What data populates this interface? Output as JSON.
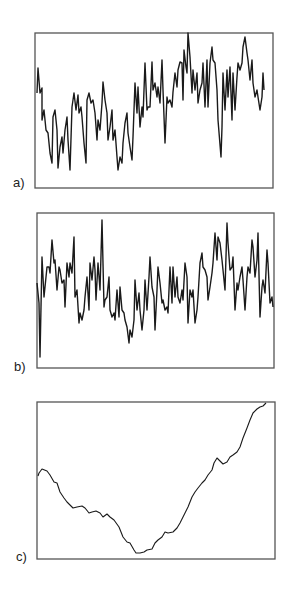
{
  "figure": {
    "panels": [
      {
        "label": "a)",
        "label_pos": [
          13,
          175
        ]
      },
      {
        "label": "b)",
        "label_pos": [
          14,
          359
        ]
      },
      {
        "label": "c)",
        "label_pos": [
          16,
          549
        ]
      }
    ]
  },
  "style": {
    "frame_color": "#555555",
    "line_color": "#1a1a1a",
    "background": "#ffffff"
  },
  "chart_data": [
    {
      "type": "line",
      "title": "a)",
      "xlabel": "",
      "ylabel": "",
      "grid": false,
      "legend": false,
      "frame": [
        35,
        33,
        273,
        188
      ],
      "note": "points in page pixel coordinates [x, y]",
      "points": [
        [
          37,
          93
        ],
        [
          38,
          68
        ],
        [
          40,
          93
        ],
        [
          42,
          88
        ],
        [
          42,
          120
        ],
        [
          44,
          110
        ],
        [
          46,
          130
        ],
        [
          48,
          133
        ],
        [
          50,
          153
        ],
        [
          52,
          163
        ],
        [
          53,
          117
        ],
        [
          55,
          110
        ],
        [
          57,
          130
        ],
        [
          58,
          168
        ],
        [
          60,
          147
        ],
        [
          62,
          137
        ],
        [
          63,
          153
        ],
        [
          65,
          130
        ],
        [
          67,
          117
        ],
        [
          68,
          140
        ],
        [
          70,
          170
        ],
        [
          72,
          107
        ],
        [
          74,
          93
        ],
        [
          76,
          110
        ],
        [
          78,
          95
        ],
        [
          79,
          113
        ],
        [
          81,
          107
        ],
        [
          82,
          117
        ],
        [
          84,
          143
        ],
        [
          86,
          163
        ],
        [
          87,
          100
        ],
        [
          89,
          93
        ],
        [
          91,
          103
        ],
        [
          93,
          100
        ],
        [
          95,
          113
        ],
        [
          97,
          140
        ],
        [
          98,
          120
        ],
        [
          100,
          130
        ],
        [
          102,
          103
        ],
        [
          103,
          82
        ],
        [
          105,
          100
        ],
        [
          107,
          113
        ],
        [
          108,
          140
        ],
        [
          110,
          127
        ],
        [
          112,
          110
        ],
        [
          113,
          140
        ],
        [
          115,
          130
        ],
        [
          117,
          157
        ],
        [
          118,
          170
        ],
        [
          120,
          157
        ],
        [
          122,
          163
        ],
        [
          123,
          143
        ],
        [
          125,
          123
        ],
        [
          127,
          113
        ],
        [
          128,
          133
        ],
        [
          130,
          147
        ],
        [
          132,
          160
        ],
        [
          133,
          137
        ],
        [
          135,
          83
        ],
        [
          137,
          113
        ],
        [
          138,
          87
        ],
        [
          140,
          127
        ],
        [
          142,
          107
        ],
        [
          143,
          117
        ],
        [
          145,
          63
        ],
        [
          147,
          110
        ],
        [
          148,
          107
        ],
        [
          150,
          107
        ],
        [
          152,
          62
        ],
        [
          153,
          90
        ],
        [
          155,
          83
        ],
        [
          157,
          97
        ],
        [
          158,
          87
        ],
        [
          160,
          103
        ],
        [
          162,
          60
        ],
        [
          163,
          90
        ],
        [
          165,
          143
        ],
        [
          167,
          97
        ],
        [
          168,
          103
        ],
        [
          170,
          100
        ],
        [
          172,
          107
        ],
        [
          173,
          92
        ],
        [
          175,
          73
        ],
        [
          177,
          87
        ],
        [
          178,
          70
        ],
        [
          180,
          62
        ],
        [
          182,
          63
        ],
        [
          183,
          100
        ],
        [
          184,
          50
        ],
        [
          186,
          67
        ],
        [
          187,
          73
        ],
        [
          188,
          33
        ],
        [
          190,
          57
        ],
        [
          192,
          93
        ],
        [
          193,
          70
        ],
        [
          195,
          90
        ],
        [
          197,
          73
        ],
        [
          198,
          103
        ],
        [
          200,
          90
        ],
        [
          202,
          83
        ],
        [
          203,
          63
        ],
        [
          205,
          107
        ],
        [
          207,
          60
        ],
        [
          208,
          107
        ],
        [
          210,
          63
        ],
        [
          212,
          47
        ],
        [
          213,
          60
        ],
        [
          215,
          63
        ],
        [
          217,
          90
        ],
        [
          218,
          120
        ],
        [
          221,
          157
        ],
        [
          222,
          127
        ],
        [
          223,
          73
        ],
        [
          225,
          110
        ],
        [
          227,
          70
        ],
        [
          228,
          97
        ],
        [
          230,
          67
        ],
        [
          232,
          120
        ],
        [
          233,
          73
        ],
        [
          235,
          110
        ],
        [
          237,
          77
        ],
        [
          238,
          63
        ],
        [
          240,
          70
        ],
        [
          242,
          63
        ],
        [
          243,
          47
        ],
        [
          245,
          37
        ],
        [
          247,
          53
        ],
        [
          248,
          60
        ],
        [
          250,
          80
        ],
        [
          252,
          60
        ],
        [
          253,
          83
        ],
        [
          255,
          97
        ],
        [
          257,
          90
        ],
        [
          258,
          97
        ],
        [
          260,
          110
        ],
        [
          262,
          97
        ],
        [
          263,
          73
        ],
        [
          264,
          90
        ]
      ]
    },
    {
      "type": "line",
      "title": "b)",
      "xlabel": "",
      "ylabel": "",
      "grid": false,
      "legend": false,
      "frame": [
        37,
        213,
        274,
        368
      ],
      "note": "points in page pixel coordinates [x, y]",
      "points": [
        [
          37,
          283
        ],
        [
          39,
          303
        ],
        [
          40,
          357
        ],
        [
          42,
          257
        ],
        [
          44,
          297
        ],
        [
          45,
          287
        ],
        [
          47,
          267
        ],
        [
          49,
          267
        ],
        [
          50,
          273
        ],
        [
          52,
          240
        ],
        [
          54,
          263
        ],
        [
          55,
          260
        ],
        [
          57,
          290
        ],
        [
          59,
          267
        ],
        [
          60,
          270
        ],
        [
          62,
          283
        ],
        [
          64,
          280
        ],
        [
          65,
          307
        ],
        [
          67,
          263
        ],
        [
          69,
          277
        ],
        [
          70,
          263
        ],
        [
          72,
          273
        ],
        [
          74,
          237
        ],
        [
          75,
          297
        ],
        [
          77,
          290
        ],
        [
          79,
          323
        ],
        [
          80,
          313
        ],
        [
          82,
          320
        ],
        [
          84,
          310
        ],
        [
          85,
          297
        ],
        [
          87,
          277
        ],
        [
          89,
          310
        ],
        [
          90,
          263
        ],
        [
          92,
          280
        ],
        [
          94,
          257
        ],
        [
          95,
          270
        ],
        [
          96,
          300
        ],
        [
          98,
          263
        ],
        [
          100,
          290
        ],
        [
          102,
          220
        ],
        [
          104,
          307
        ],
        [
          105,
          300
        ],
        [
          107,
          297
        ],
        [
          109,
          277
        ],
        [
          110,
          310
        ],
        [
          112,
          317
        ],
        [
          114,
          313
        ],
        [
          115,
          320
        ],
        [
          117,
          290
        ],
        [
          119,
          317
        ],
        [
          120,
          287
        ],
        [
          122,
          310
        ],
        [
          124,
          313
        ],
        [
          125,
          320
        ],
        [
          127,
          327
        ],
        [
          129,
          343
        ],
        [
          130,
          330
        ],
        [
          132,
          337
        ],
        [
          134,
          320
        ],
        [
          135,
          280
        ],
        [
          137,
          310
        ],
        [
          139,
          293
        ],
        [
          140,
          310
        ],
        [
          142,
          330
        ],
        [
          144,
          310
        ],
        [
          145,
          280
        ],
        [
          147,
          310
        ],
        [
          149,
          277
        ],
        [
          150,
          257
        ],
        [
          152,
          287
        ],
        [
          154,
          297
        ],
        [
          155,
          330
        ],
        [
          157,
          290
        ],
        [
          158,
          267
        ],
        [
          160,
          283
        ],
        [
          162,
          303
        ],
        [
          163,
          300
        ],
        [
          165,
          310
        ],
        [
          167,
          307
        ],
        [
          168,
          313
        ],
        [
          170,
          267
        ],
        [
          172,
          303
        ],
        [
          173,
          267
        ],
        [
          175,
          297
        ],
        [
          177,
          277
        ],
        [
          178,
          297
        ],
        [
          180,
          303
        ],
        [
          182,
          290
        ],
        [
          183,
          300
        ],
        [
          185,
          263
        ],
        [
          187,
          277
        ],
        [
          188,
          323
        ],
        [
          190,
          290
        ],
        [
          192,
          297
        ],
        [
          193,
          290
        ],
        [
          195,
          323
        ],
        [
          197,
          310
        ],
        [
          198,
          297
        ],
        [
          200,
          263
        ],
        [
          202,
          253
        ],
        [
          203,
          267
        ],
        [
          205,
          270
        ],
        [
          207,
          277
        ],
        [
          208,
          300
        ],
        [
          210,
          287
        ],
        [
          212,
          273
        ],
        [
          213,
          263
        ],
        [
          215,
          233
        ],
        [
          217,
          260
        ],
        [
          218,
          237
        ],
        [
          220,
          243
        ],
        [
          222,
          260
        ],
        [
          223,
          270
        ],
        [
          225,
          290
        ],
        [
          227,
          223
        ],
        [
          228,
          243
        ],
        [
          230,
          270
        ],
        [
          232,
          267
        ],
        [
          233,
          257
        ],
        [
          235,
          310
        ],
        [
          237,
          283
        ],
        [
          238,
          290
        ],
        [
          240,
          277
        ],
        [
          242,
          267
        ],
        [
          243,
          280
        ],
        [
          245,
          310
        ],
        [
          247,
          277
        ],
        [
          248,
          267
        ],
        [
          250,
          273
        ],
        [
          252,
          240
        ],
        [
          253,
          247
        ],
        [
          255,
          277
        ],
        [
          257,
          260
        ],
        [
          258,
          233
        ],
        [
          260,
          317
        ],
        [
          262,
          287
        ],
        [
          263,
          280
        ],
        [
          265,
          293
        ],
        [
          267,
          250
        ],
        [
          268,
          263
        ],
        [
          270,
          303
        ],
        [
          272,
          297
        ],
        [
          273,
          307
        ]
      ]
    },
    {
      "type": "line",
      "title": "c)",
      "xlabel": "",
      "ylabel": "",
      "grid": false,
      "legend": false,
      "frame": [
        37,
        402,
        275,
        559
      ],
      "note": "points in page pixel coordinates [x, y]",
      "points": [
        [
          38,
          476
        ],
        [
          39,
          473
        ],
        [
          42,
          469
        ],
        [
          47,
          471
        ],
        [
          50,
          475
        ],
        [
          54,
          482
        ],
        [
          57,
          483
        ],
        [
          60,
          492
        ],
        [
          64,
          498
        ],
        [
          67,
          502
        ],
        [
          70,
          505
        ],
        [
          73,
          508
        ],
        [
          77,
          507
        ],
        [
          82,
          506
        ],
        [
          85,
          508
        ],
        [
          89,
          513
        ],
        [
          92,
          512
        ],
        [
          96,
          511
        ],
        [
          100,
          513
        ],
        [
          103,
          517
        ],
        [
          107,
          514
        ],
        [
          110,
          517
        ],
        [
          114,
          520
        ],
        [
          119,
          527
        ],
        [
          123,
          537
        ],
        [
          127,
          542
        ],
        [
          130,
          543
        ],
        [
          134,
          550
        ],
        [
          136,
          553
        ],
        [
          140,
          553
        ],
        [
          144,
          552
        ],
        [
          147,
          550
        ],
        [
          152,
          549
        ],
        [
          155,
          543
        ],
        [
          158,
          540
        ],
        [
          162,
          537
        ],
        [
          165,
          532
        ],
        [
          168,
          533
        ],
        [
          173,
          532
        ],
        [
          177,
          528
        ],
        [
          180,
          523
        ],
        [
          185,
          513
        ],
        [
          188,
          507
        ],
        [
          192,
          497
        ],
        [
          195,
          492
        ],
        [
          198,
          488
        ],
        [
          202,
          483
        ],
        [
          205,
          480
        ],
        [
          208,
          475
        ],
        [
          212,
          470
        ],
        [
          214,
          463
        ],
        [
          217,
          458
        ],
        [
          220,
          461
        ],
        [
          223,
          464
        ],
        [
          227,
          462
        ],
        [
          230,
          457
        ],
        [
          233,
          455
        ],
        [
          237,
          452
        ],
        [
          240,
          447
        ],
        [
          243,
          438
        ],
        [
          247,
          428
        ],
        [
          250,
          420
        ],
        [
          253,
          413
        ],
        [
          257,
          409
        ],
        [
          260,
          407
        ],
        [
          263,
          406
        ],
        [
          266,
          403
        ]
      ]
    }
  ]
}
